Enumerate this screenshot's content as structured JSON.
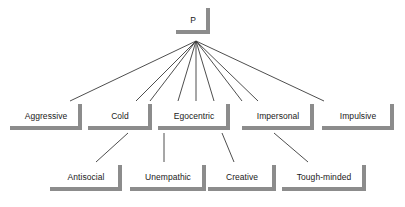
{
  "diagram": {
    "type": "hierarchy-tree",
    "title": "P",
    "levels": 3,
    "style": {
      "shadow_color": "#8c8c8c",
      "line_color": "#3a3a3a",
      "text_color": "#1a1a1a",
      "background": "#ffffff"
    },
    "root": {
      "id": "p",
      "label": "P",
      "x": 176,
      "y": 8,
      "w": 34,
      "h": 26
    },
    "level2": [
      {
        "id": "aggressive",
        "label": "Aggressive",
        "x": 10,
        "y": 104,
        "w": 72,
        "h": 26
      },
      {
        "id": "cold",
        "label": "Cold",
        "x": 88,
        "y": 104,
        "w": 64,
        "h": 26
      },
      {
        "id": "egocentric",
        "label": "Egocentric",
        "x": 158,
        "y": 104,
        "w": 72,
        "h": 26
      },
      {
        "id": "impersonal",
        "label": "Impersonal",
        "x": 242,
        "y": 104,
        "w": 72,
        "h": 26
      },
      {
        "id": "impulsive",
        "label": "Impulsive",
        "x": 322,
        "y": 104,
        "w": 72,
        "h": 26
      }
    ],
    "level3": [
      {
        "id": "antisocial",
        "label": "Antisocial",
        "x": 50,
        "y": 165,
        "w": 72,
        "h": 26
      },
      {
        "id": "unempathic",
        "label": "Unempathic",
        "x": 130,
        "y": 165,
        "w": 76,
        "h": 26
      },
      {
        "id": "creative",
        "label": "Creative",
        "x": 208,
        "y": 165,
        "w": 68,
        "h": 26
      },
      {
        "id": "toughminded",
        "label": "Tough-minded",
        "x": 282,
        "y": 165,
        "w": 84,
        "h": 26
      }
    ],
    "edges": [
      {
        "from": "p",
        "to": "aggressive",
        "x1": 196,
        "y1": 41,
        "x2": 70,
        "y2": 101
      },
      {
        "from": "p",
        "to": "cold-left",
        "x1": 196,
        "y1": 41,
        "x2": 136,
        "y2": 101
      },
      {
        "from": "p",
        "to": "cold-right",
        "x1": 196,
        "y1": 41,
        "x2": 150,
        "y2": 101
      },
      {
        "from": "p",
        "to": "ego-left",
        "x1": 196,
        "y1": 41,
        "x2": 178,
        "y2": 101
      },
      {
        "from": "p",
        "to": "ego-center",
        "x1": 196,
        "y1": 41,
        "x2": 196,
        "y2": 101
      },
      {
        "from": "p",
        "to": "ego-right",
        "x1": 196,
        "y1": 41,
        "x2": 214,
        "y2": 101
      },
      {
        "from": "p",
        "to": "imp-left",
        "x1": 196,
        "y1": 41,
        "x2": 242,
        "y2": 101
      },
      {
        "from": "p",
        "to": "imp-right",
        "x1": 196,
        "y1": 41,
        "x2": 258,
        "y2": 101
      },
      {
        "from": "p",
        "to": "impulsive",
        "x1": 196,
        "y1": 41,
        "x2": 324,
        "y2": 101
      },
      {
        "from": "cold",
        "to": "antisocial",
        "x1": 128,
        "y1": 133,
        "x2": 96,
        "y2": 162
      },
      {
        "from": "egocentric",
        "to": "unempathic",
        "x1": 164,
        "y1": 133,
        "x2": 164,
        "y2": 162
      },
      {
        "from": "egocentric",
        "to": "creative",
        "x1": 222,
        "y1": 133,
        "x2": 234,
        "y2": 162
      },
      {
        "from": "impersonal",
        "to": "toughminded",
        "x1": 274,
        "y1": 133,
        "x2": 308,
        "y2": 162
      }
    ]
  }
}
